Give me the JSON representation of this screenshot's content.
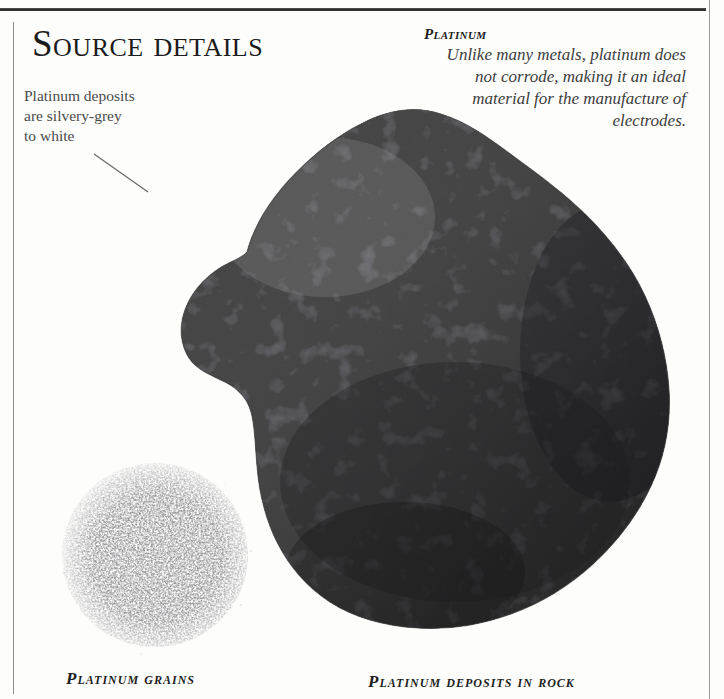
{
  "page": {
    "background_color": "#fdfdfc",
    "ink_color": "#1b1b1b",
    "rule_color": "#262626"
  },
  "section": {
    "title": "Source details"
  },
  "annotation": {
    "text": "Platinum deposits are silvery-grey to white",
    "leader_line": "leader-line"
  },
  "caption_panel": {
    "title": "Platinum",
    "body": "Unlike many metals, platinum does not corrode, making it an ideal material for the manufacture of electrodes."
  },
  "figures": [
    {
      "id": "platinum-grains",
      "caption": "Platinum grains",
      "description": "Circular pile of fine silvery-grey platinum grains"
    },
    {
      "id": "platinum-deposits-in-rock",
      "caption": "Platinum deposits in rock",
      "description": "Large craggy dark grey rock specimen with bright white platinum veins"
    }
  ]
}
